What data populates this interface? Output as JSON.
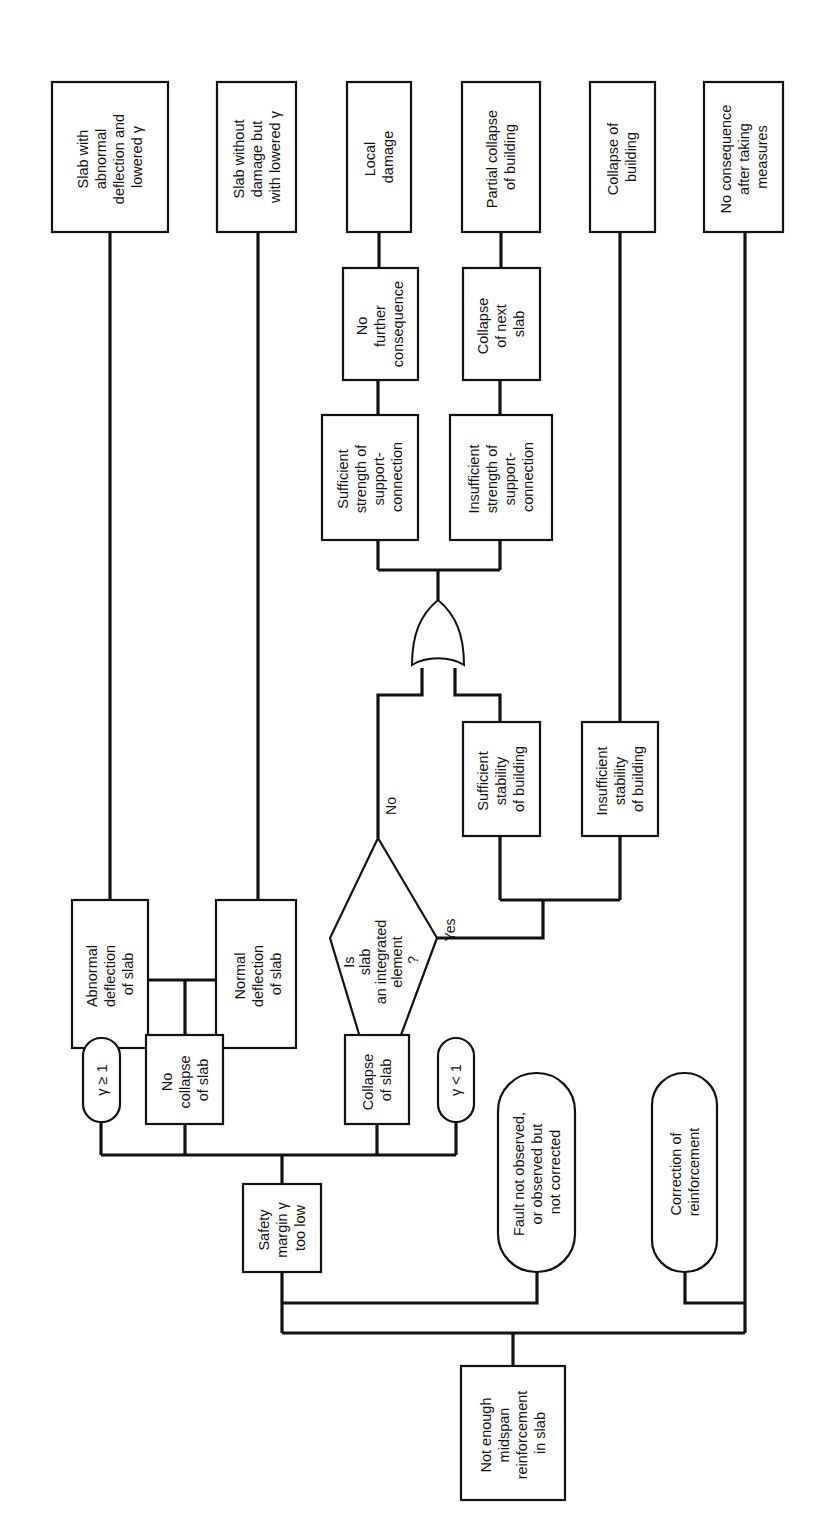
{
  "diagram": {
    "orientation": "rotated-90-ccw",
    "root": {
      "lines": [
        "Not enough",
        "midspan",
        "reinforcement",
        "in slab"
      ]
    },
    "branches": {
      "fault": {
        "lines": [
          "Fault not observed,",
          "or observed but",
          "not corrected"
        ]
      },
      "correction": {
        "lines": [
          "Correction of",
          "reinforcement"
        ]
      }
    },
    "safety_margin": {
      "lines": [
        "Safety",
        "margin γ",
        "too low"
      ]
    },
    "conditions": {
      "gamma_ge_1": "γ ≥ 1",
      "gamma_lt_1": "γ < 1"
    },
    "no_collapse": {
      "lines": [
        "No",
        "collapse",
        "of slab"
      ]
    },
    "collapse_slab": {
      "lines": [
        "Collapse",
        "of slab"
      ]
    },
    "abnormal_deflection": {
      "lines": [
        "Abnormal",
        "deflection",
        "of slab"
      ]
    },
    "normal_deflection": {
      "lines": [
        "Normal",
        "deflection",
        "of slab"
      ]
    },
    "decision": {
      "lines": [
        "Is",
        "slab",
        "an integrated",
        "element",
        "?"
      ],
      "yes_label": "Yes",
      "no_label": "No"
    },
    "sufficient_stability": {
      "lines": [
        "Sufficient",
        "stability",
        "of building"
      ]
    },
    "insufficient_stability": {
      "lines": [
        "Insufficient",
        "stability",
        "of building"
      ]
    },
    "sufficient_strength": {
      "lines": [
        "Sufficient",
        "strength of",
        "support-",
        "connection"
      ]
    },
    "insufficient_strength": {
      "lines": [
        "Insufficient",
        "strength of",
        "support-",
        "connection"
      ]
    },
    "no_further": {
      "lines": [
        "No",
        "further",
        "consequence"
      ]
    },
    "collapse_next": {
      "lines": [
        "Collapse",
        "of next",
        "slab"
      ]
    },
    "outcomes": {
      "slab_abnormal": {
        "lines": [
          "Slab with",
          "abnormal",
          "deflection and",
          "lowered γ"
        ]
      },
      "slab_without_damage": {
        "lines": [
          "Slab without",
          "damage but",
          "with lowered γ"
        ]
      },
      "local_damage": {
        "lines": [
          "Local",
          "damage"
        ]
      },
      "partial_collapse": {
        "lines": [
          "Partial collapse",
          "of building"
        ]
      },
      "collapse_building": {
        "lines": [
          "Collapse of",
          "building"
        ]
      },
      "no_consequence": {
        "lines": [
          "No consequence",
          "after taking",
          "measures"
        ]
      }
    }
  }
}
